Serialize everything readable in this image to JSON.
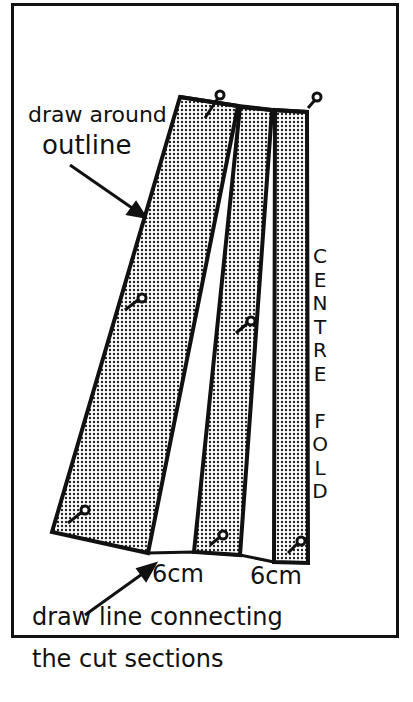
{
  "diagram": {
    "labels": {
      "draw_around_line1": "draw around",
      "draw_around_line2": "outline",
      "spread_1": "6cm",
      "spread_2": "6cm",
      "connect_line1": "draw line connecting",
      "connect_line2": "the cut sections",
      "centre_fold": [
        "C",
        "E",
        "N",
        "T",
        "R",
        "E",
        "",
        "F",
        "O",
        "L",
        "D"
      ]
    },
    "pieces": [
      {
        "name": "side-panel",
        "fill": "dotted"
      },
      {
        "name": "middle-panel",
        "fill": "dotted"
      },
      {
        "name": "centre-panel",
        "fill": "dotted"
      }
    ],
    "colors": {
      "ink": "#111111",
      "paper": "#ffffff"
    }
  }
}
